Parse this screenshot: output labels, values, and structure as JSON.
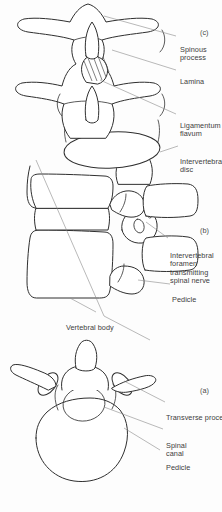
{
  "figure": {
    "background_color": "#fdfdfd",
    "line_color": "#2f2f2f",
    "label_color": "#404040",
    "leader_color": "#8a8a8a",
    "orientation": "rotated-90-ccw"
  },
  "panels": [
    {
      "id": "a",
      "marker": "(a)",
      "caption": "Superior (axial) view of a single lumbar vertebra",
      "labels": [
        {
          "key": "pedicle",
          "text": "Pedicle"
        },
        {
          "key": "spinal_canal",
          "text": "Spinal\ncanal"
        },
        {
          "key": "transverse_process",
          "text": "Transverse process"
        }
      ]
    },
    {
      "id": "b",
      "marker": "(b)",
      "caption": "Anterior (coronal) view of two adjacent lumbar vertebrae",
      "labels": [
        {
          "key": "vertebral_body",
          "text": "Vertebral body"
        },
        {
          "key": "pedicle",
          "text": "Pedicle"
        },
        {
          "key": "foramen",
          "text": "Intervertebral\nforamen\ntransmitting\nspinal nerve"
        }
      ]
    },
    {
      "id": "c",
      "marker": "(c)",
      "caption": "Lateral (sagittal) view of two adjacent lumbar vertebrae",
      "labels": [
        {
          "key": "intervertebral_disc",
          "text": "Intervertebral\ndisc"
        },
        {
          "key": "ligamentum_flavum",
          "text": "Ligamentum\nflavum"
        },
        {
          "key": "lamina",
          "text": "Lamina"
        },
        {
          "key": "spinous_process",
          "text": "Spinous\nprocess"
        }
      ]
    }
  ]
}
